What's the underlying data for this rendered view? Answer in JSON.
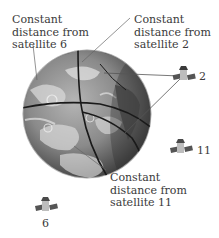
{
  "labels": {
    "sat6": {
      "line1": "Constant",
      "line2": "distance from",
      "line3": "satellite 6"
    },
    "sat2": {
      "line1": "Constant",
      "line2": "distance from",
      "line3": "satellite 2"
    },
    "sat11": {
      "line1": "Constant",
      "line2": "distance from",
      "line3": "satellite 11"
    }
  },
  "satellites": [
    {
      "id": "2",
      "label": "2"
    },
    {
      "id": "11",
      "label": "11"
    },
    {
      "id": "6",
      "label": "6"
    }
  ],
  "colors": {
    "text": "#3a3a3a",
    "globe_dark": "#3c3c3c",
    "globe_mid": "#8a8a8a",
    "globe_light": "#e2e2e2",
    "arc": "#1a1a1a",
    "leader": "#666666"
  }
}
